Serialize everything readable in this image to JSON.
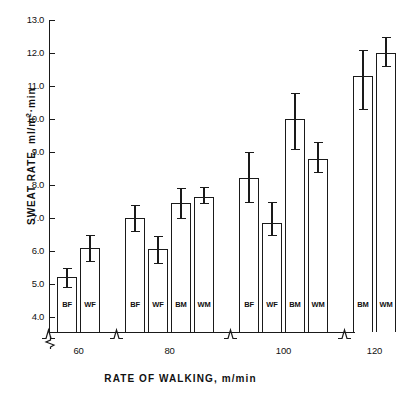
{
  "chart_data": {
    "type": "bar",
    "title": "",
    "xlabel": "RATE OF WALKING, m/min",
    "ylabel": "SWEAT RATE, ml/m2·min",
    "ylabel_parts": {
      "pre": "SWEAT RATE, ml/m",
      "sup": "2",
      "post": "·min"
    },
    "ylim": [
      4.0,
      13.0
    ],
    "ytick_labels": [
      "13.0",
      "12.0",
      "11.0",
      "10.0",
      "9.0",
      "8.0",
      "7.0",
      "6.0",
      "5.0",
      "4.0"
    ],
    "ytick_values": [
      13.0,
      12.0,
      11.0,
      10.0,
      9.0,
      8.0,
      7.0,
      6.0,
      5.0,
      4.0
    ],
    "grid": false,
    "legend": "none",
    "axis_break_y": true,
    "axis_break_x": true,
    "categories": [
      "60",
      "80",
      "100",
      "120"
    ],
    "group_labels": [
      "60",
      "80",
      "100",
      "120"
    ],
    "series_labels": [
      "BF",
      "WF",
      "BM",
      "WM"
    ],
    "groups": [
      {
        "category": "60",
        "bars": [
          {
            "label": "BF",
            "value": 5.2,
            "err_low": 4.9,
            "err_high": 5.5
          },
          {
            "label": "WF",
            "value": 6.1,
            "err_low": 5.7,
            "err_high": 6.5
          }
        ]
      },
      {
        "category": "80",
        "bars": [
          {
            "label": "BF",
            "value": 7.0,
            "err_low": 6.6,
            "err_high": 7.4
          },
          {
            "label": "WF",
            "value": 6.05,
            "err_low": 5.65,
            "err_high": 6.45
          },
          {
            "label": "BM",
            "value": 7.45,
            "err_low": 7.0,
            "err_high": 7.9
          },
          {
            "label": "WM",
            "value": 7.65,
            "err_low": 7.45,
            "err_high": 7.95
          }
        ]
      },
      {
        "category": "100",
        "bars": [
          {
            "label": "BF",
            "value": 8.2,
            "err_low": 7.5,
            "err_high": 9.0
          },
          {
            "label": "WF",
            "value": 6.85,
            "err_low": 6.5,
            "err_high": 7.5
          },
          {
            "label": "BM",
            "value": 10.0,
            "err_low": 9.1,
            "err_high": 10.8
          },
          {
            "label": "WM",
            "value": 8.8,
            "err_low": 8.4,
            "err_high": 9.3
          }
        ]
      },
      {
        "category": "120",
        "bars": [
          {
            "label": "BM",
            "value": 11.3,
            "err_low": 10.3,
            "err_high": 12.1
          },
          {
            "label": "WM",
            "value": 12.0,
            "err_low": 11.6,
            "err_high": 12.5
          }
        ]
      }
    ]
  }
}
